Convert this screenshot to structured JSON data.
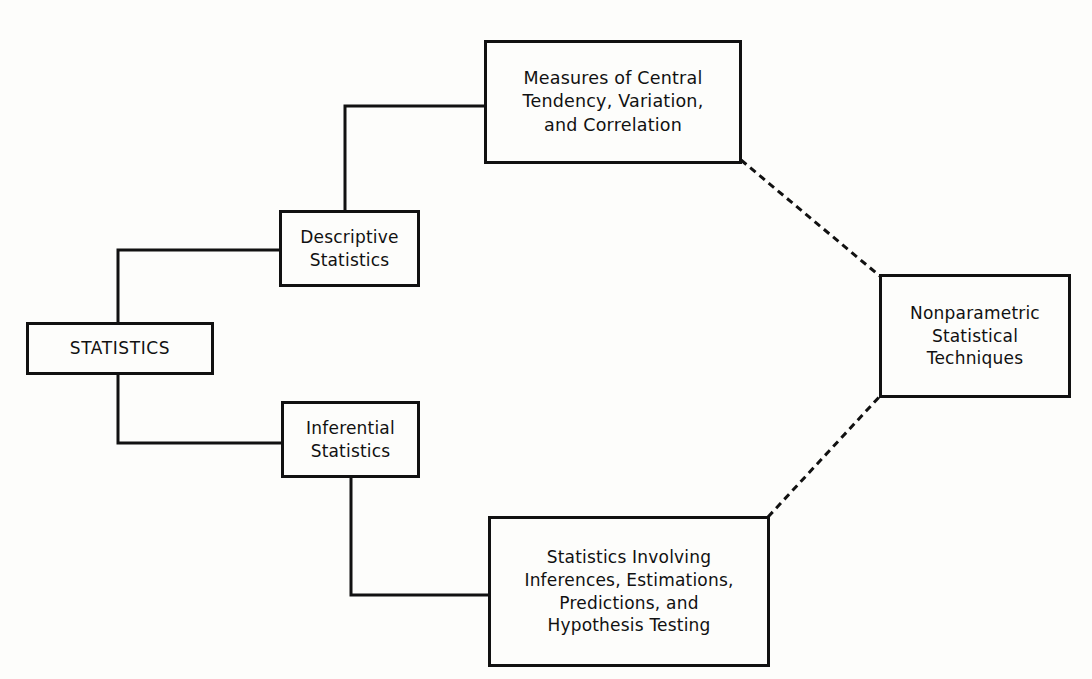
{
  "diagram": {
    "type": "hierarchy",
    "nodes": {
      "root": {
        "id": "root",
        "lines": [
          "STATISTICS"
        ]
      },
      "descriptive": {
        "id": "descriptive",
        "lines": [
          "Descriptive",
          "Statistics"
        ]
      },
      "inferential": {
        "id": "inferential",
        "lines": [
          "Inferential",
          "Statistics"
        ]
      },
      "measures": {
        "id": "measures",
        "lines": [
          "Measures of Central",
          "Tendency, Variation,",
          "and Correlation"
        ]
      },
      "inference_methods": {
        "id": "inference_methods",
        "lines": [
          "Statistics Involving",
          "Inferences, Estimations,",
          "Predictions, and",
          "Hypothesis Testing"
        ]
      },
      "nonparametric": {
        "id": "nonparametric",
        "lines": [
          "Nonparametric",
          "Statistical",
          "Techniques"
        ]
      }
    },
    "edges": [
      {
        "from": "root",
        "to": "descriptive",
        "style": "solid"
      },
      {
        "from": "root",
        "to": "inferential",
        "style": "solid"
      },
      {
        "from": "descriptive",
        "to": "measures",
        "style": "solid"
      },
      {
        "from": "inferential",
        "to": "inference_methods",
        "style": "solid"
      },
      {
        "from": "measures",
        "to": "nonparametric",
        "style": "dashed"
      },
      {
        "from": "inference_methods",
        "to": "nonparametric",
        "style": "dashed"
      }
    ],
    "colors": {
      "line": "#111111",
      "background": "#fdfdfb"
    }
  }
}
